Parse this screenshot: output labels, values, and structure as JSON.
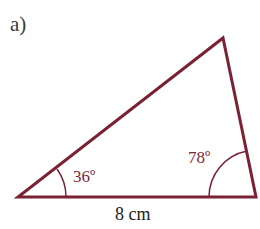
{
  "part_label": "a)",
  "triangle": {
    "stroke_color": "#7a2233",
    "vertices": {
      "left": [
        18,
        197
      ],
      "right": [
        256,
        197
      ],
      "top": [
        223,
        38
      ]
    },
    "angles": {
      "left": "36º",
      "right": "78º"
    },
    "base_length": "8 cm"
  }
}
